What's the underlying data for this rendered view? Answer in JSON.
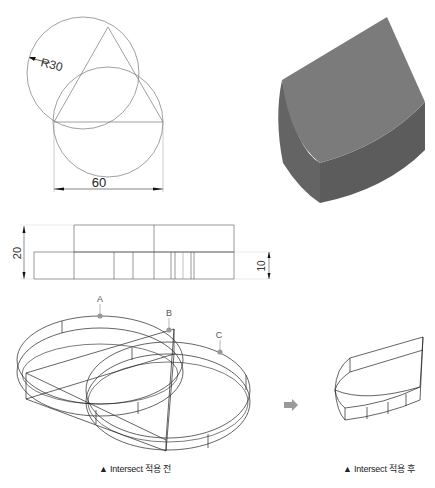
{
  "top_view": {
    "radius_label": "R30",
    "width_label": "60"
  },
  "front_view": {
    "height_label_total": "20",
    "height_label_lower": "10"
  },
  "iso_before": {
    "markers": [
      {
        "label": "A",
        "color": "#999999"
      },
      {
        "label": "B",
        "color": "#999999"
      },
      {
        "label": "C",
        "color": "#999999"
      }
    ],
    "caption": "▲ Intersect 적용 전"
  },
  "iso_after": {
    "caption": "▲ Intersect 적용 후"
  },
  "arrow": {
    "color": "#9a9a9a"
  },
  "solid": {
    "top_color": "#7a7a7a",
    "side_color": "#5f5f5f",
    "front_color": "#6a6a6a"
  }
}
